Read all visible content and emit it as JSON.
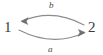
{
  "diagram": {
    "type": "directed-graph",
    "title": "",
    "background_color": "#ffffff",
    "stroke_color": "#8c8c8c",
    "text_color": "#3b3b3b",
    "nodes": [
      {
        "id": "1",
        "label": "1",
        "position": "left"
      },
      {
        "id": "2",
        "label": "2",
        "position": "right"
      }
    ],
    "edges": [
      {
        "id": "b",
        "label": "b",
        "from": "2",
        "to": "1",
        "curve": "arc-above",
        "label_position": "top-center",
        "arrowhead_at": "1"
      },
      {
        "id": "a",
        "label": "a",
        "from": "1",
        "to": "2",
        "curve": "arc-below",
        "label_position": "bottom-center",
        "arrowhead_at": "2"
      }
    ]
  }
}
